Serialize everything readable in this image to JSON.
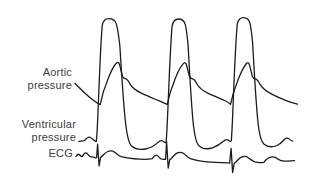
{
  "figure": {
    "background_color": "#ffffff",
    "stroke_color": "#1b1b1b",
    "label_color": "#3c3c3c",
    "labels": {
      "aortic": "Aortic\npressure",
      "ventricular": "Ventricular\npressure",
      "ecg": "ECG"
    },
    "traces": [
      {
        "name": "aortic-pressure-trace",
        "label": "Aortic pressure",
        "stroke_width": 1.3,
        "path": "M 75,83.5 C 79,87.5 84,92.5 89,96.8 C 93,100.2 97,103.2 100.2,104.6 C 101.8,99 102.8,92.5 104.3,89.2 C 105.8,85.5 107.3,80.5 109.3,75.7 C 111.6,70.2 114.3,65.3 116.5,63.0 C 117.4,62.1 118.6,62.2 119.3,63.9 C 120.5,67.5 121.4,72.8 122.4,76.2 C 123.2,78.3 124.8,78.6 126.4,79.1 C 127.9,79.6 128.6,81.2 129.6,83.4 C 132.2,88 136.2,90.8 141.2,93.2 C 147.2,96 153.2,98.4 158.7,100.7 C 162.2,102.2 165.2,103.6 167.2,104.5 C 168.8,99 169.8,92.8 171.3,89.4 C 172.8,85.7 174.3,80.7 176.3,76 C 178.6,70.5 181.3,65.8 183.5,63.4 C 184.4,62.4 185.6,62.6 186.3,64.3 C 187.5,68 188.4,73 189.4,76.3 C 190.2,78.4 191.8,78.7 193.4,79.2 C 194.9,79.7 195.6,81.3 196.6,83.5 C 199.2,88 203.2,91 208.2,93.3 C 214.2,96.1 220.2,98.5 224.7,100.5 C 227.2,101.7 229.2,103 230.5,104.3 C 232.1,99 233.1,93 234.6,89.5 C 236.1,85.8 237.6,80.8 239.6,76.1 C 241.9,70.6 244.3,65.9 246.5,63.5 C 247.4,62.5 248.6,62.7 249.3,64.4 C 250.5,68 251.4,73 252.4,76.4 C 253.2,78.5 254.8,78.8 256.4,79.3 C 257.9,79.8 258.6,81.4 259.6,83.6 C 262.2,88.2 266.2,91.2 271.2,93.8 C 276.2,96.3 281.2,98.6 286.2,100.6 C 290.2,102.2 294.2,103.4 297.5,104.2"
      },
      {
        "name": "ventricular-pressure-trace",
        "label": "Ventricular pressure",
        "stroke_width": 1.3,
        "path": "M 79,141.3 L 84.5,140.6 C 86,139 87.5,136.8 89.5,137.2 C 91.5,137.7 93.5,140.6 96.3,141.6 C 97.8,135 99.5,55 102.3,25.0 C 103.3,20.3 105.8,18.6 108.8,18.6 C 111.8,18.6 114.8,19.6 116.2,23.6 C 117.6,27.6 118.6,35 119.8,45 C 121.6,73 123.4,105 125.7,124 C 126.9,134 128.6,143.2 131.4,145.8 C 135.4,149.6 140.4,150 145.4,149 C 150.4,148 154.6,145.6 157.7,142.6 C 159.8,140.6 161.8,139.9 163.3,141.4 C 164.4,142.6 165.4,142.9 166.1,142.0 C 167.6,130 169.3,58 172.1,26.2 C 173.1,20.7 175.6,19.0 178.4,19.0 C 181.4,19.0 184.0,20.2 185.2,24.4 C 186.4,28.4 187.0,35 188.0,44 C 189.6,72 191.2,104 193.3,124 C 194.4,134 196.2,143.3 199.1,145.9 C 203.1,149.4 208.1,149.3 213.1,147.6 C 217.1,146.2 220.3,144.1 223.1,141.6 C 225.1,139.7 227.1,139.0 228.7,140.4 C 229.8,141.5 230.7,141.6 231.3,140.8 C 232.8,126 234.4,54 237.3,24.0 C 238.3,18.9 240.8,17.6 243.5,17.6 C 246.6,17.6 248.9,19.2 250.0,23.4 C 251.1,27.5 251.7,34 252.6,42.5 C 254.2,71 255.8,102 258.1,123.5 C 259.2,133.5 261.1,141.8 264.1,144.3 C 268.1,147.5 272.9,147.1 276.9,145.5 C 279.9,144.3 281.9,142.3 283.9,140.0 C 285.5,138.1 287.4,137.4 289.0,138.9 C 290.4,140.2 291.6,140.9 292.7,141.1"
      },
      {
        "name": "ecg-trace",
        "label": "ECG",
        "stroke_width": 1.3,
        "path": "M 76,156.5 C 77.3,154.3 78.3,153.6 79.4,154.7 C 80.5,155.8 81.2,156.6 82.3,156.6 C 83.7,153.9 85.1,152.2 86.6,153.1 C 88.1,154.0 88.7,156.1 90.2,156.7 L 93.5,157.1 L 95.5,157.8 L 96.6,157.6 L 97.6,144.2 L 99.1,165.8 L 100.6,157.4 C 103,155.8 105.2,152.4 107.7,151.5 C 110.2,150.6 112.7,150.7 114.7,152.2 C 116.7,153.7 118.2,155.6 121.2,156.6 C 127,158.2 134,158.8 140,159.2 C 145,159.5 149.5,159.2 152.3,158.7 C 154.1,155.8 155.8,154.6 157.3,155.5 C 158.8,156.4 159.5,158.4 161.0,158.9 L 164,159.4 L 165.6,159.3 L 166.6,141.6 L 168.2,168.2 L 169.7,159.9 C 172.2,158.1 174.4,154.4 176.9,153.2 C 179.4,152.1 181.9,152.3 183.9,153.8 C 185.9,155.3 187.4,157.3 190.4,158.6 C 196.4,160.6 203.4,161.7 210.4,162.2 C 217.4,162.7 223.4,162.6 227.9,162.9 L 229.6,163.1 L 231.1,148.3 L 232.6,172.6 L 234.1,163.6 C 236.6,161.7 238.8,158.2 241.3,157.1 C 243.8,156.0 246.3,156.2 248.3,157.7 C 250.3,159.2 251.8,160.9 254.8,161.9 C 257.8,162.8 260.8,162.8 263.8,162.3 C 265.8,159.8 268.3,157.6 270.8,157.1 C 273.3,156.6 275.8,157.2 277.8,158.9 C 279.8,160.6 281.8,161.2 284.8,161.2 C 287.8,161.2 291.0,160.9 294.5,160.6"
      }
    ]
  }
}
